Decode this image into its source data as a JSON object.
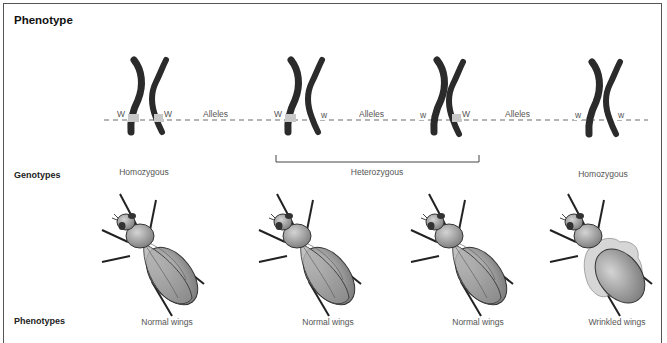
{
  "title": "Phenotype",
  "row_labels": {
    "genotypes": "Genotypes",
    "phenotypes": "Phenotypes"
  },
  "chromosome_pairs": [
    {
      "left_allele": "W",
      "right_allele": "W",
      "left_marked": true,
      "right_marked": true
    },
    {
      "left_allele": "W",
      "right_allele": "w",
      "left_marked": true,
      "right_marked": false
    },
    {
      "left_allele": "w",
      "right_allele": "W",
      "left_marked": false,
      "right_marked": true
    },
    {
      "left_allele": "w",
      "right_allele": "w",
      "left_marked": false,
      "right_marked": false
    }
  ],
  "alleles_labels": [
    "Alleles",
    "Alleles",
    "Alleles"
  ],
  "genotypes": {
    "left": "Homozygous",
    "middle": "Heterozygous",
    "right": "Homozygous"
  },
  "phenotypes": [
    "Normal wings",
    "Normal wings",
    "Normal wings",
    "Wrinkled wings"
  ],
  "colors": {
    "chromosome": "#2b2b2b",
    "allele_band": "#c8c8c8",
    "fly_body": "#9a9a9a",
    "fly_outline": "#333333",
    "wrinkled_wing": "#cfcfcf"
  }
}
